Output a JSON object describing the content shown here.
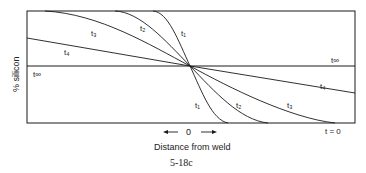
{
  "figure": {
    "y_axis_label": "% silicon",
    "x_axis_label": "Distance from weld",
    "origin_label": "0",
    "caption": "5-18c"
  },
  "curves": {
    "t1_upper": "t₁",
    "t2_upper": "t₂",
    "t3_upper": "t₃",
    "t4_upper": "t₄",
    "tinf_left": "t∞",
    "tinf_right": "t∞",
    "t4_lower": "t₄",
    "t3_lower": "t₃",
    "t2_lower": "t₂",
    "t1_lower": "t₁",
    "t0": "t = 0"
  },
  "colors": {
    "line": "#1a1a1a",
    "background": "#ffffff"
  }
}
